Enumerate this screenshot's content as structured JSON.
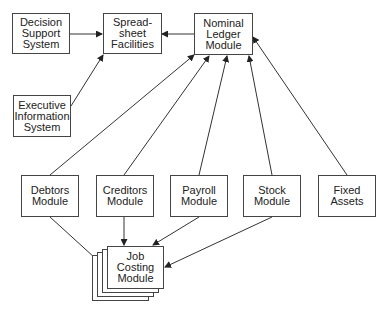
{
  "diagram": {
    "nodes": {
      "dss": {
        "label": "Decision\nSupport\nSystem"
      },
      "spreadsheet": {
        "label": "Spread-\nsheet\nFacilities"
      },
      "nominal": {
        "label": "Nominal\nLedger\nModule"
      },
      "eis": {
        "label": "Executive\nInformation\nSystem"
      },
      "debtors": {
        "label": "Debtors\nModule"
      },
      "creditors": {
        "label": "Creditors\nModule"
      },
      "payroll": {
        "label": "Payroll\nModule"
      },
      "stock": {
        "label": "Stock\nModule"
      },
      "fixed": {
        "label": "Fixed\nAssets"
      },
      "jobcosting": {
        "label": "Job\nCosting\nModule"
      }
    },
    "edges": [
      {
        "from": "Decision Support System",
        "to": "Spreadsheet Facilities"
      },
      {
        "from": "Nominal Ledger Module",
        "to": "Spreadsheet Facilities"
      },
      {
        "from": "Executive Information System",
        "to": "Spreadsheet Facilities"
      },
      {
        "from": "Debtors Module",
        "to": "Nominal Ledger Module"
      },
      {
        "from": "Creditors Module",
        "to": "Nominal Ledger Module"
      },
      {
        "from": "Payroll Module",
        "to": "Nominal Ledger Module"
      },
      {
        "from": "Stock Module",
        "to": "Nominal Ledger Module"
      },
      {
        "from": "Fixed Assets",
        "to": "Nominal Ledger Module"
      },
      {
        "from": "Debtors Module",
        "to": "Job Costing Module"
      },
      {
        "from": "Creditors Module",
        "to": "Job Costing Module"
      },
      {
        "from": "Payroll Module",
        "to": "Job Costing Module"
      },
      {
        "from": "Stock Module",
        "to": "Job Costing Module"
      }
    ],
    "colors": {
      "line": "#333333",
      "border": "#444444",
      "text": "#222222"
    }
  }
}
